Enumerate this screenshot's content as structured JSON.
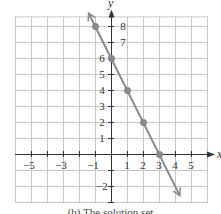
{
  "chart_data": {
    "type": "line",
    "title": "",
    "xlabel": "x",
    "ylabel": "y",
    "xlim": [
      -6,
      6
    ],
    "ylim": [
      -3,
      8.6
    ],
    "grid": true,
    "x_tick_labels": [
      "-5",
      "-3",
      "-1",
      "1",
      "2",
      "3",
      "4",
      "5"
    ],
    "x_tick_values": [
      -5,
      -3,
      -1,
      1,
      2,
      3,
      4,
      5
    ],
    "y_tick_labels": [
      "8",
      "7",
      "6",
      "5",
      "4",
      "3",
      "2",
      "1",
      "-1",
      "-2"
    ],
    "y_tick_values": [
      8,
      7,
      6,
      5,
      4,
      3,
      2,
      1,
      -1,
      -2
    ],
    "series": [
      {
        "name": "line",
        "equation": "y = -2x + 6",
        "points": [
          [
            -1,
            8
          ],
          [
            0,
            6
          ],
          [
            1,
            4
          ],
          [
            2,
            2
          ],
          [
            3,
            0
          ]
        ],
        "line_extent": [
          [
            -1.4,
            8.8
          ],
          [
            4.3,
            -2.6
          ]
        ],
        "color": "#8a8a8a"
      }
    ]
  },
  "caption": "(b) The solution set"
}
